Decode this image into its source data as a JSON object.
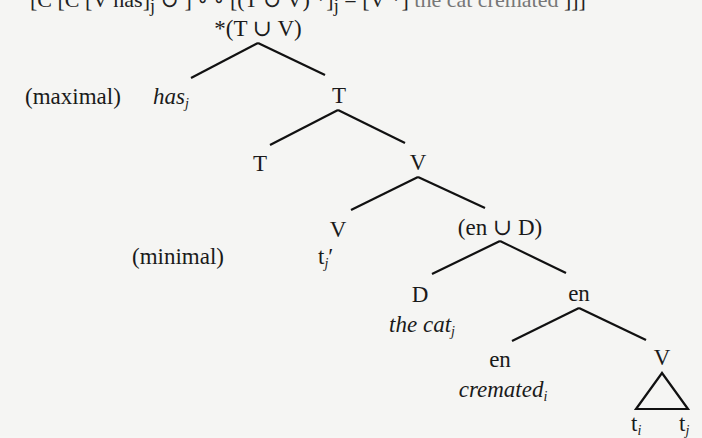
{
  "page": {
    "truncated_top_line": {
      "left": "[C [C [V has]",
      "sub1": "j",
      "mid": " ∪ ] ∘ ∘ [(T ∪ V) *]",
      "sub2": "j",
      "right": " = [V *]",
      "faint": " the cat cremated",
      "end": " ]]]"
    }
  },
  "tree": {
    "root": {
      "label": "*(T ∪ V)"
    },
    "has": {
      "label": "has",
      "sub": "j",
      "annotation": "(maximal)"
    },
    "T_upper": {
      "label": "T"
    },
    "T_lower": {
      "label": "T"
    },
    "V_upper": {
      "label": "V"
    },
    "V_minimal": {
      "label": "V",
      "trace": "t",
      "trace_sub": "j",
      "trace_prime": "′",
      "annotation": "(minimal)"
    },
    "en_union_D": {
      "label": "(en ∪ D)"
    },
    "D": {
      "label": "D",
      "word": "the cat",
      "word_sub": "j"
    },
    "en_upper": {
      "label": "en"
    },
    "en_lower": {
      "label": "en",
      "word": "cremated",
      "word_sub": "i"
    },
    "V_lower": {
      "label": "V",
      "triangle_left": "t",
      "triangle_left_sub": "i",
      "triangle_right": "t",
      "triangle_right_sub": "j"
    }
  }
}
